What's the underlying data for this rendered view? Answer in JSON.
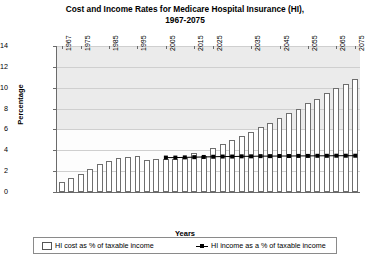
{
  "chart_data": {
    "type": "bar",
    "title": "Cost and Income Rates for Medicare Hospital Insurance (HI), 1967-2075",
    "title_line1": "Cost and Income Rates for Medicare Hospital Insurance (HI),",
    "title_line2": "1967-2075",
    "xlabel": "Years",
    "ylabel": "Percentage",
    "ylim": [
      0,
      14
    ],
    "ytick_labels": [
      "0",
      "2",
      "4",
      "6",
      "8",
      "10",
      "12",
      "14"
    ],
    "ytick_values": [
      0,
      2,
      4,
      6,
      8,
      10,
      12,
      14
    ],
    "grid": true,
    "legend_position": "bottom",
    "x_start": 1967,
    "x_step": 3.5,
    "categories": [
      "1967",
      "1970",
      "1974",
      "1977",
      "1981",
      "1984",
      "1988",
      "1991",
      "1995",
      "1998",
      "2002",
      "2005",
      "2009",
      "2012",
      "2016",
      "2019",
      "2023",
      "2026",
      "2030",
      "2033",
      "2037",
      "2040",
      "2044",
      "2047",
      "2051",
      "2054",
      "2058",
      "2061",
      "2065",
      "2068",
      "2072",
      "2075"
    ],
    "xtick_labels": [
      "1967",
      "1975",
      "1985",
      "1995",
      "2005",
      "2015",
      "2025",
      "2035",
      "2045",
      "2055",
      "2065",
      "2075"
    ],
    "xtick_indices": [
      0,
      2,
      5,
      8,
      11,
      14,
      16,
      20,
      23,
      26,
      29,
      31
    ],
    "series": [
      {
        "name": "HI cost as % of taxable income",
        "type": "bar",
        "color": "#ffffff",
        "edge_color": "#6e6e6e",
        "values": [
          0.95,
          1.35,
          1.75,
          2.25,
          2.65,
          2.95,
          3.25,
          3.35,
          3.45,
          3.05,
          3.2,
          3.2,
          3.2,
          3.3,
          3.75,
          3.45,
          4.25,
          4.6,
          5.0,
          5.35,
          5.75,
          6.2,
          6.6,
          7.05,
          7.55,
          7.95,
          8.5,
          8.95,
          9.5,
          9.95,
          10.4,
          10.8
        ]
      },
      {
        "name": "HI income as a % of taxable income",
        "type": "line",
        "color": "#000000",
        "marker": "square",
        "start_index": 11,
        "values": [
          null,
          null,
          null,
          null,
          null,
          null,
          null,
          null,
          null,
          null,
          null,
          3.3,
          3.3,
          3.32,
          3.34,
          3.36,
          3.38,
          3.4,
          3.4,
          3.42,
          3.42,
          3.44,
          3.44,
          3.45,
          3.45,
          3.46,
          3.46,
          3.47,
          3.47,
          3.48,
          3.48,
          3.48
        ]
      }
    ]
  },
  "legend": {
    "items": [
      {
        "label": "HI cost as % of taxable income",
        "marker": "bar-swatch"
      },
      {
        "label": "HI income as a % of taxable income",
        "marker": "line-marker"
      }
    ]
  }
}
